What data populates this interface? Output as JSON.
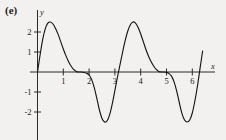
{
  "figure": {
    "panel_label": "(e)",
    "background_color": "#f2f1ef",
    "curve_color": "#161616",
    "axis_color": "#2b2b2b"
  },
  "axes": {
    "x_axis_name": "x",
    "y_axis_name": "y",
    "x_ticks": [
      "1",
      "2",
      "3",
      "4",
      "5",
      "6"
    ],
    "y_ticks": [
      "2",
      "1",
      "-1",
      "-2"
    ]
  },
  "chart_data": {
    "type": "line",
    "title": "",
    "xlabel": "x",
    "ylabel": "y",
    "xlim": [
      -0.15,
      7.3
    ],
    "ylim": [
      -3.0,
      3.0
    ],
    "grid": false,
    "legend": null,
    "x_ticks": [
      1,
      2,
      3,
      4,
      5,
      6
    ],
    "y_ticks": [
      2,
      1,
      -1,
      -2
    ],
    "annotations": [
      "(e)"
    ],
    "series": [
      {
        "name": "curve",
        "x": [
          0.0,
          0.1,
          0.2,
          0.3,
          0.4,
          0.5,
          0.6,
          0.7,
          0.8,
          0.9,
          1.0,
          1.1,
          1.2,
          1.3,
          1.4,
          1.5,
          1.6,
          1.7,
          1.8,
          1.9,
          2.0,
          2.1,
          2.2,
          2.3,
          2.4,
          2.5,
          2.6,
          2.7,
          2.8,
          2.9,
          3.0,
          3.1,
          3.2,
          3.3,
          3.4,
          3.5,
          3.6,
          3.7,
          3.8,
          3.9,
          4.0,
          4.1,
          4.2,
          4.3,
          4.4,
          4.5,
          4.6,
          4.7,
          4.8,
          4.9,
          5.0,
          5.1,
          5.2,
          5.3,
          5.4,
          5.5,
          5.6,
          5.7,
          5.8,
          5.9,
          6.0,
          6.1,
          6.2,
          6.3,
          6.4
        ],
        "y": [
          0.0,
          0.85,
          1.62,
          2.16,
          2.44,
          2.5,
          2.4,
          2.18,
          1.88,
          1.52,
          1.15,
          0.82,
          0.53,
          0.3,
          0.13,
          0.03,
          0.0,
          0.0,
          -0.02,
          -0.06,
          -0.15,
          -0.38,
          -0.78,
          -1.32,
          -1.9,
          -2.32,
          -2.5,
          -2.44,
          -2.12,
          -1.58,
          -0.92,
          -0.25,
          0.38,
          1.0,
          1.58,
          2.05,
          2.36,
          2.5,
          2.44,
          2.22,
          1.9,
          1.52,
          1.14,
          0.8,
          0.52,
          0.3,
          0.13,
          0.03,
          0.0,
          0.0,
          -0.02,
          -0.08,
          -0.22,
          -0.52,
          -0.98,
          -1.55,
          -2.08,
          -2.4,
          -2.5,
          -2.4,
          -2.05,
          -1.45,
          -0.7,
          0.18,
          1.05
        ]
      }
    ]
  }
}
